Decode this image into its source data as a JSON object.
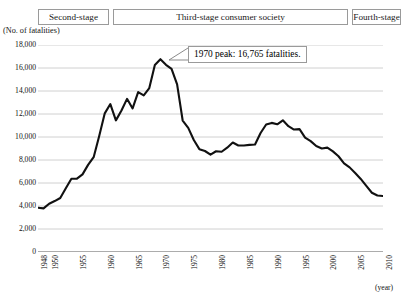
{
  "stages": [
    {
      "label": "Second-stage",
      "left": 38,
      "width": 71
    },
    {
      "label": "Third-stage consumer society",
      "left": 113,
      "width": 235
    },
    {
      "label": "Fourth-stage",
      "left": 352,
      "width": 49
    }
  ],
  "axis": {
    "y_title": "(No. of fatalities)",
    "x_unit": "(year)"
  },
  "annotation": {
    "text": "1970 peak: 16,765 fatalities."
  },
  "chart_data": {
    "type": "line",
    "title": "",
    "subtitle": "",
    "xlabel": "(year)",
    "ylabel": "(No. of fatalities)",
    "xlim": [
      1948,
      2010
    ],
    "ylim": [
      0,
      18000
    ],
    "grid": true,
    "legend": false,
    "y_ticks": [
      0,
      2000,
      4000,
      6000,
      8000,
      10000,
      12000,
      14000,
      16000,
      18000
    ],
    "y_tick_labels": [
      "0",
      "2,000",
      "4,000",
      "6,000",
      "8,000",
      "10,000",
      "12,000",
      "14,000",
      "16,000",
      "18,000"
    ],
    "x_ticks": [
      1948,
      1950,
      1955,
      1960,
      1965,
      1970,
      1975,
      1980,
      1985,
      1990,
      1995,
      2000,
      2005,
      2010
    ],
    "x_tick_labels": [
      "1948",
      "1950",
      "1955",
      "1960",
      "1965",
      "1970",
      "1975",
      "1980",
      "1985",
      "1990",
      "1995",
      "2000",
      "2005",
      "2010"
    ],
    "line_color": "#111111",
    "grid_color": "#c4c4c4",
    "annotations": [
      {
        "x": 1970,
        "y": 16765,
        "text": "1970 peak: 16,765 fatalities."
      }
    ],
    "x": [
      1948,
      1949,
      1950,
      1951,
      1952,
      1953,
      1954,
      1955,
      1956,
      1957,
      1958,
      1959,
      1960,
      1961,
      1962,
      1963,
      1964,
      1965,
      1966,
      1967,
      1968,
      1969,
      1970,
      1971,
      1972,
      1973,
      1974,
      1975,
      1976,
      1977,
      1978,
      1979,
      1980,
      1981,
      1982,
      1983,
      1984,
      1985,
      1986,
      1987,
      1988,
      1989,
      1990,
      1991,
      1992,
      1993,
      1994,
      1995,
      1996,
      1997,
      1998,
      1999,
      2000,
      2001,
      2002,
      2003,
      2004,
      2005,
      2006,
      2007,
      2008,
      2009,
      2010
    ],
    "y": [
      3848,
      3790,
      4202,
      4429,
      4696,
      5544,
      6374,
      6379,
      6751,
      7575,
      8248,
      10079,
      12055,
      12865,
      11445,
      12301,
      13318,
      12484,
      13904,
      13618,
      14256,
      16257,
      16765,
      16278,
      15918,
      14574,
      11432,
      10792,
      9734,
      8945,
      8783,
      8466,
      8760,
      8719,
      9073,
      9520,
      9262,
      9261,
      9317,
      9347,
      10344,
      11086,
      11227,
      11105,
      11452,
      10942,
      10649,
      10684,
      9942,
      9640,
      9211,
      9006,
      9073,
      8747,
      8326,
      7702,
      7358,
      6871,
      6352,
      5744,
      5155,
      4914,
      4863
    ],
    "series": [
      {
        "name": "Traffic fatalities",
        "values": [
          3848,
          3790,
          4202,
          4429,
          4696,
          5544,
          6374,
          6379,
          6751,
          7575,
          8248,
          10079,
          12055,
          12865,
          11445,
          12301,
          13318,
          12484,
          13904,
          13618,
          14256,
          16257,
          16765,
          16278,
          15918,
          14574,
          11432,
          10792,
          9734,
          8945,
          8783,
          8466,
          8760,
          8719,
          9073,
          9520,
          9262,
          9261,
          9317,
          9347,
          10344,
          11086,
          11227,
          11105,
          11452,
          10942,
          10649,
          10684,
          9942,
          9640,
          9211,
          9006,
          9073,
          8747,
          8326,
          7702,
          7358,
          6871,
          6352,
          5744,
          5155,
          4914,
          4863
        ]
      }
    ]
  }
}
